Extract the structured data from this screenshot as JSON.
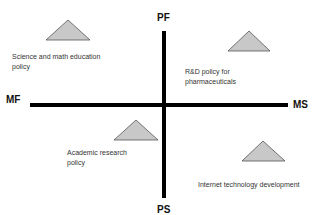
{
  "diagram": {
    "type": "quadrant",
    "axes": {
      "top": "PF",
      "bottom": "PS",
      "left": "MF",
      "right": "MS"
    },
    "colors": {
      "axis": "#000000",
      "triangle_fill": "#c8c8c8",
      "triangle_stroke": "#555555",
      "label_text": "#333333",
      "axis_text": "#111111"
    },
    "items": [
      {
        "quadrant": "top-left",
        "label_lines": [
          "Science and math education",
          "policy"
        ],
        "marker": "triangle"
      },
      {
        "quadrant": "top-right",
        "label_lines": [
          "R&D policy for",
          "pharmaceuticals"
        ],
        "marker": "triangle"
      },
      {
        "quadrant": "bottom-left",
        "label_lines": [
          "Academic research",
          "policy"
        ],
        "marker": "triangle"
      },
      {
        "quadrant": "bottom-right",
        "label_lines": [
          "Internet technology development"
        ],
        "marker": "triangle"
      }
    ]
  }
}
